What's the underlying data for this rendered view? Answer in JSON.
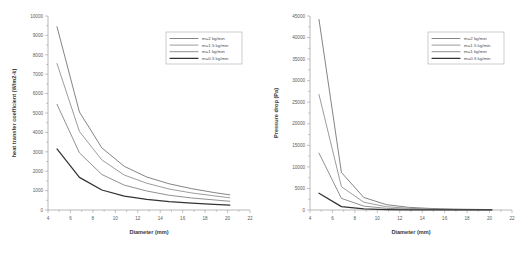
{
  "figure": {
    "background": "#ffffff",
    "panel_count": 2
  },
  "series_style": [
    {
      "key": "m2",
      "color": "#6e6e6e",
      "width": 0.85
    },
    {
      "key": "m15",
      "color": "#8a8a8a",
      "width": 0.85
    },
    {
      "key": "m1",
      "color": "#7d7d7d",
      "width": 0.85
    },
    {
      "key": "m05",
      "color": "#333333",
      "width": 1.25
    }
  ],
  "chart_data": [
    {
      "id": "heat-transfer-chart",
      "type": "line",
      "title": "",
      "xlabel": "Diameter (mm)",
      "ylabel": "heat transfer coefficient (W/m2-k)",
      "xlim": [
        4,
        22
      ],
      "ylim": [
        0,
        10000
      ],
      "xticks": [
        4,
        6,
        8,
        10,
        12,
        14,
        16,
        18,
        20,
        22
      ],
      "yticks": [
        0,
        1000,
        2000,
        3000,
        4000,
        5000,
        6000,
        7000,
        8000,
        9000,
        10000
      ],
      "xticklabels": [
        "4",
        "6",
        "8",
        "10",
        "12",
        "14",
        "16",
        "18",
        "20",
        "22"
      ],
      "yticklabels": [
        "0",
        "1000",
        "2000",
        "3000",
        "4000",
        "5000",
        "6000",
        "7000",
        "8000",
        "9000",
        "10000"
      ],
      "minor_ticks": true,
      "grid": false,
      "legend_position": "upper right",
      "x": [
        4.8,
        6.8,
        8.8,
        10.8,
        12.8,
        14.8,
        16.8,
        18.8,
        20.2
      ],
      "series": [
        {
          "name": "m=2 kg/min",
          "values": [
            9450,
            5050,
            3200,
            2250,
            1700,
            1350,
            1100,
            900,
            780
          ]
        },
        {
          "name": "m=1.5 kg/min",
          "values": [
            7550,
            4050,
            2580,
            1800,
            1380,
            1080,
            880,
            730,
            630
          ]
        },
        {
          "name": "m=1 kg/min",
          "values": [
            5450,
            2950,
            1830,
            1280,
            980,
            760,
            620,
            520,
            450
          ]
        },
        {
          "name": "m=0.5 kg/min",
          "values": [
            3150,
            1680,
            1030,
            720,
            550,
            430,
            350,
            290,
            250
          ]
        }
      ]
    },
    {
      "id": "pressure-drop-chart",
      "type": "line",
      "title": "",
      "xlabel": "Diameter (mm)",
      "ylabel": "Pressure drop (Pa)",
      "xlim": [
        4,
        22
      ],
      "ylim": [
        0,
        45000
      ],
      "xticks": [
        4,
        6,
        8,
        10,
        12,
        14,
        16,
        18,
        20,
        22
      ],
      "yticks": [
        0,
        5000,
        10000,
        15000,
        20000,
        25000,
        30000,
        35000,
        40000,
        45000
      ],
      "xticklabels": [
        "4",
        "6",
        "8",
        "10",
        "12",
        "14",
        "16",
        "18",
        "20",
        "22"
      ],
      "yticklabels": [
        "0",
        "5000",
        "10000",
        "15000",
        "20000",
        "25000",
        "30000",
        "35000",
        "40000",
        "45000"
      ],
      "minor_ticks": true,
      "grid": false,
      "legend_position": "upper right",
      "x": [
        4.8,
        6.8,
        8.8,
        10.8,
        12.8,
        14.8,
        16.8,
        18.8,
        20.2
      ],
      "series": [
        {
          "name": "m=2 kg/min",
          "values": [
            44200,
            8700,
            2900,
            1250,
            620,
            350,
            210,
            140,
            100
          ]
        },
        {
          "name": "m=1.5 kg/min",
          "values": [
            26800,
            5400,
            1800,
            760,
            390,
            215,
            130,
            85,
            62
          ]
        },
        {
          "name": "m=1 kg/min",
          "values": [
            13200,
            2700,
            900,
            390,
            195,
            110,
            66,
            44,
            32
          ]
        },
        {
          "name": "m=0.5 kg/min",
          "values": [
            3900,
            780,
            260,
            110,
            56,
            32,
            19,
            13,
            9
          ]
        }
      ]
    }
  ],
  "legend": {
    "entries": [
      {
        "label": "m=2 kg/min"
      },
      {
        "label": "m=1.5 kg/min"
      },
      {
        "label": "m=1 kg/min"
      },
      {
        "label": "m=0.5 kg/min"
      }
    ]
  }
}
